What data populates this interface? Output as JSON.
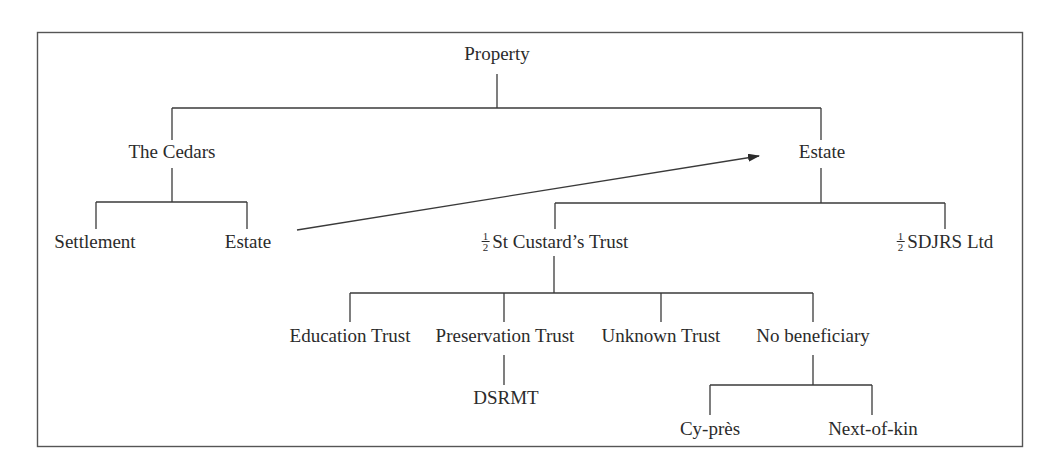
{
  "diagram": {
    "type": "tree",
    "colors": {
      "line": "#3a3a3a",
      "text": "#2b2b2b",
      "frame": "#555555",
      "background": "#ffffff"
    },
    "root": {
      "id": "property",
      "label": "Property"
    },
    "nodes": {
      "property": {
        "label": "Property"
      },
      "the_cedars": {
        "label": "The Cedars"
      },
      "estate_top": {
        "label": "Estate"
      },
      "settlement": {
        "label": "Settlement"
      },
      "cedars_estate": {
        "label": "Estate"
      },
      "st_custards": {
        "fraction": {
          "num": "1",
          "den": "2"
        },
        "label": "St Custard’s Trust"
      },
      "sdjrs": {
        "fraction": {
          "num": "1",
          "den": "2"
        },
        "label": "SDJRS Ltd"
      },
      "education_trust": {
        "label": "Education Trust"
      },
      "preservation_trust": {
        "label": "Preservation Trust"
      },
      "unknown_trust": {
        "label": "Unknown Trust"
      },
      "no_beneficiary": {
        "label": "No beneficiary"
      },
      "dsrmt": {
        "label": "DSRMT"
      },
      "cy_pres": {
        "label": "Cy-près"
      },
      "next_of_kin": {
        "label": "Next-of-kin"
      }
    },
    "edges": [
      {
        "from": "property",
        "to": "the_cedars"
      },
      {
        "from": "property",
        "to": "estate_top"
      },
      {
        "from": "the_cedars",
        "to": "settlement"
      },
      {
        "from": "the_cedars",
        "to": "cedars_estate"
      },
      {
        "from": "cedars_estate",
        "to": "estate_top",
        "style": "arrow"
      },
      {
        "from": "estate_top",
        "to": "st_custards"
      },
      {
        "from": "estate_top",
        "to": "sdjrs"
      },
      {
        "from": "st_custards",
        "to": "education_trust"
      },
      {
        "from": "st_custards",
        "to": "preservation_trust"
      },
      {
        "from": "st_custards",
        "to": "unknown_trust"
      },
      {
        "from": "st_custards",
        "to": "no_beneficiary"
      },
      {
        "from": "preservation_trust",
        "to": "dsrmt"
      },
      {
        "from": "no_beneficiary",
        "to": "cy_pres"
      },
      {
        "from": "no_beneficiary",
        "to": "next_of_kin"
      }
    ]
  }
}
